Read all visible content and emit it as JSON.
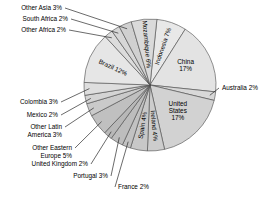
{
  "chart_data": {
    "type": "pie",
    "title": "",
    "subtitle": "",
    "xlabel": "",
    "ylabel": "",
    "legend": "none",
    "grid": false,
    "units": "percent",
    "total": 100,
    "categories": [
      "Indonesia",
      "China",
      "Australia",
      "United States",
      "Ireland",
      "Spain",
      "France",
      "Portugal",
      "United Kingdom",
      "Other Eastern Europe",
      "Other Latin America",
      "Mexico",
      "Colombia",
      "Brazil",
      "Other Africa",
      "South Africa",
      "Other Asia",
      "Mozambique"
    ],
    "values": [
      7,
      17,
      2,
      17,
      4,
      4,
      2,
      3,
      2,
      5,
      3,
      2,
      3,
      12,
      2,
      2,
      3,
      6
    ],
    "slices": [
      {
        "name": "Indonesia",
        "value": 7,
        "label": "Indonesia 7%",
        "label_placement": "inside-rotated",
        "color": "#e8e8e8"
      },
      {
        "name": "China",
        "value": 17,
        "label_line1": "China",
        "label_line2": "17%",
        "label": "China 17%",
        "label_placement": "inside",
        "color": "#e3e3e3"
      },
      {
        "name": "Australia",
        "value": 2,
        "label": "Australia 2%",
        "label_placement": "outside-right",
        "color": "#d8d8d8"
      },
      {
        "name": "United States",
        "value": 17,
        "label_line1": "United",
        "label_line2": "States",
        "label_line3": "17%",
        "label": "United States 17%",
        "label_placement": "inside",
        "color": "#d2d2d2"
      },
      {
        "name": "Ireland",
        "value": 4,
        "label": "Ireland 4%",
        "label_placement": "inside-rotated",
        "color": "#cdcdcd"
      },
      {
        "name": "Spain",
        "value": 4,
        "label": "Spain 4%",
        "label_placement": "inside-rotated",
        "color": "#c8c8c8"
      },
      {
        "name": "France",
        "value": 2,
        "label": "France 2%",
        "label_placement": "outside-bottom",
        "color": "#c2c2c2"
      },
      {
        "name": "Portugal",
        "value": 3,
        "label": "Portugal 3%",
        "label_placement": "outside-bottom",
        "color": "#bdbdbd"
      },
      {
        "name": "United Kingdom",
        "value": 2,
        "label": "United Kingdom 2%",
        "label_placement": "outside-left",
        "color": "#b8b8b8"
      },
      {
        "name": "Other Eastern Europe",
        "value": 5,
        "label_line1": "Other Eastern",
        "label_line2": "Europe 5%",
        "label": "Other Eastern Europe 5%",
        "label_placement": "outside-left",
        "color": "#c0c0c0"
      },
      {
        "name": "Other Latin America",
        "value": 3,
        "label_line1": "Other Latin",
        "label_line2": "America 3%",
        "label": "Other Latin America 3%",
        "label_placement": "outside-left",
        "color": "#cacaca"
      },
      {
        "name": "Mexico",
        "value": 2,
        "label": "Mexico 2%",
        "label_placement": "outside-left",
        "color": "#d4d4d4"
      },
      {
        "name": "Colombia",
        "value": 3,
        "label": "Colombia 3%",
        "label_placement": "outside-left",
        "color": "#dedede"
      },
      {
        "name": "Brazil",
        "value": 12,
        "label": "Brazil 12%",
        "label_placement": "inside-rotated",
        "color": "#e6e6e6"
      },
      {
        "name": "Other Africa",
        "value": 2,
        "label": "Other Africa 2%",
        "label_placement": "outside-left",
        "color": "#dcdcdc"
      },
      {
        "name": "South Africa",
        "value": 2,
        "label": "South Africa 2%",
        "label_placement": "outside-left",
        "color": "#d6d6d6"
      },
      {
        "name": "Other Asia",
        "value": 3,
        "label": "Other Asia 3%",
        "label_placement": "outside-left",
        "color": "#d0d0d0"
      },
      {
        "name": "Mozambique",
        "value": 6,
        "label": "Mozambique 6%",
        "label_placement": "inside-rotated",
        "color": "#dadada"
      }
    ],
    "style": {
      "outline_color": "#4a4a4a",
      "text_color": "#000000",
      "background": "#ffffff",
      "leader_line_color": "#2b2b2b"
    },
    "geometry": {
      "center_x": 150,
      "center_y": 85,
      "radius": 66,
      "start_angle_deg": -84
    }
  }
}
